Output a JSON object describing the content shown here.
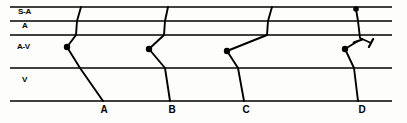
{
  "figure": {
    "type": "ladder-diagram",
    "width": 407,
    "height": 123,
    "background_color": "#fdfdfb",
    "ink_color": "#000000"
  },
  "tiers": [
    {
      "id": "sa",
      "label": "S-A",
      "label_x": 18,
      "label_y": 8,
      "top_y": 7,
      "bottom_y": 21
    },
    {
      "id": "a",
      "label": "A",
      "label_x": 22,
      "label_y": 22,
      "top_y": 21,
      "bottom_y": 35
    },
    {
      "id": "av",
      "label": "A-V",
      "label_x": 17,
      "label_y": 43,
      "top_y": 35,
      "bottom_y": 68
    },
    {
      "id": "v",
      "label": "V",
      "label_x": 22,
      "label_y": 76,
      "top_y": 68,
      "bottom_y": 101
    }
  ],
  "grid": {
    "line_x_start": 10,
    "line_x_end": 392,
    "line_color": "#000000",
    "line_width": 1.7,
    "rows_y": [
      7,
      21,
      35,
      68,
      101
    ]
  },
  "beats": [
    {
      "id": "beat-a",
      "label": "A",
      "label_x": 104,
      "label_y": 105,
      "sa_origin_x": 81,
      "a_cross_x": 77,
      "node_x": 67,
      "node_y": 47,
      "av_exit_x": 80,
      "v_end_x": 103,
      "node_dot": true,
      "blocked": false
    },
    {
      "id": "beat-b",
      "label": "B",
      "label_x": 172,
      "label_y": 105,
      "sa_origin_x": 168,
      "a_cross_x": 165,
      "node_x": 149,
      "node_y": 49,
      "av_exit_x": 165,
      "v_end_x": 170,
      "node_dot": true,
      "blocked": false
    },
    {
      "id": "beat-c",
      "label": "C",
      "label_x": 246,
      "label_y": 105,
      "sa_origin_x": 272,
      "a_cross_x": 268,
      "node_x": 227,
      "node_y": 51,
      "av_exit_x": 238,
      "v_end_x": 244,
      "node_dot": true,
      "blocked": false
    },
    {
      "id": "beat-d",
      "label": "D",
      "label_x": 362,
      "label_y": 105,
      "sa_origin_x": 356,
      "a_cross_x": 360,
      "node_x": 345,
      "node_y": 49,
      "av_exit_x": 354,
      "v_end_x": 358,
      "node_dot": true,
      "sa_dot": true,
      "blocked": true,
      "block_marks": [
        {
          "id": "block-upper",
          "x1": 360,
          "y1": 38,
          "x2": 371,
          "y2": 43,
          "bar_angle_deg": 118
        },
        {
          "id": "block-lower",
          "x1": 345,
          "y1": 49,
          "x2": 358,
          "y2": 41,
          "bar_angle_deg": 160
        }
      ]
    }
  ],
  "markers": {
    "node_dot_radius": 3.2,
    "sa_dot_radius": 2.8,
    "block_bar_length": 9
  },
  "typography": {
    "tier_label_size": 8,
    "beat_label_size": 10
  }
}
